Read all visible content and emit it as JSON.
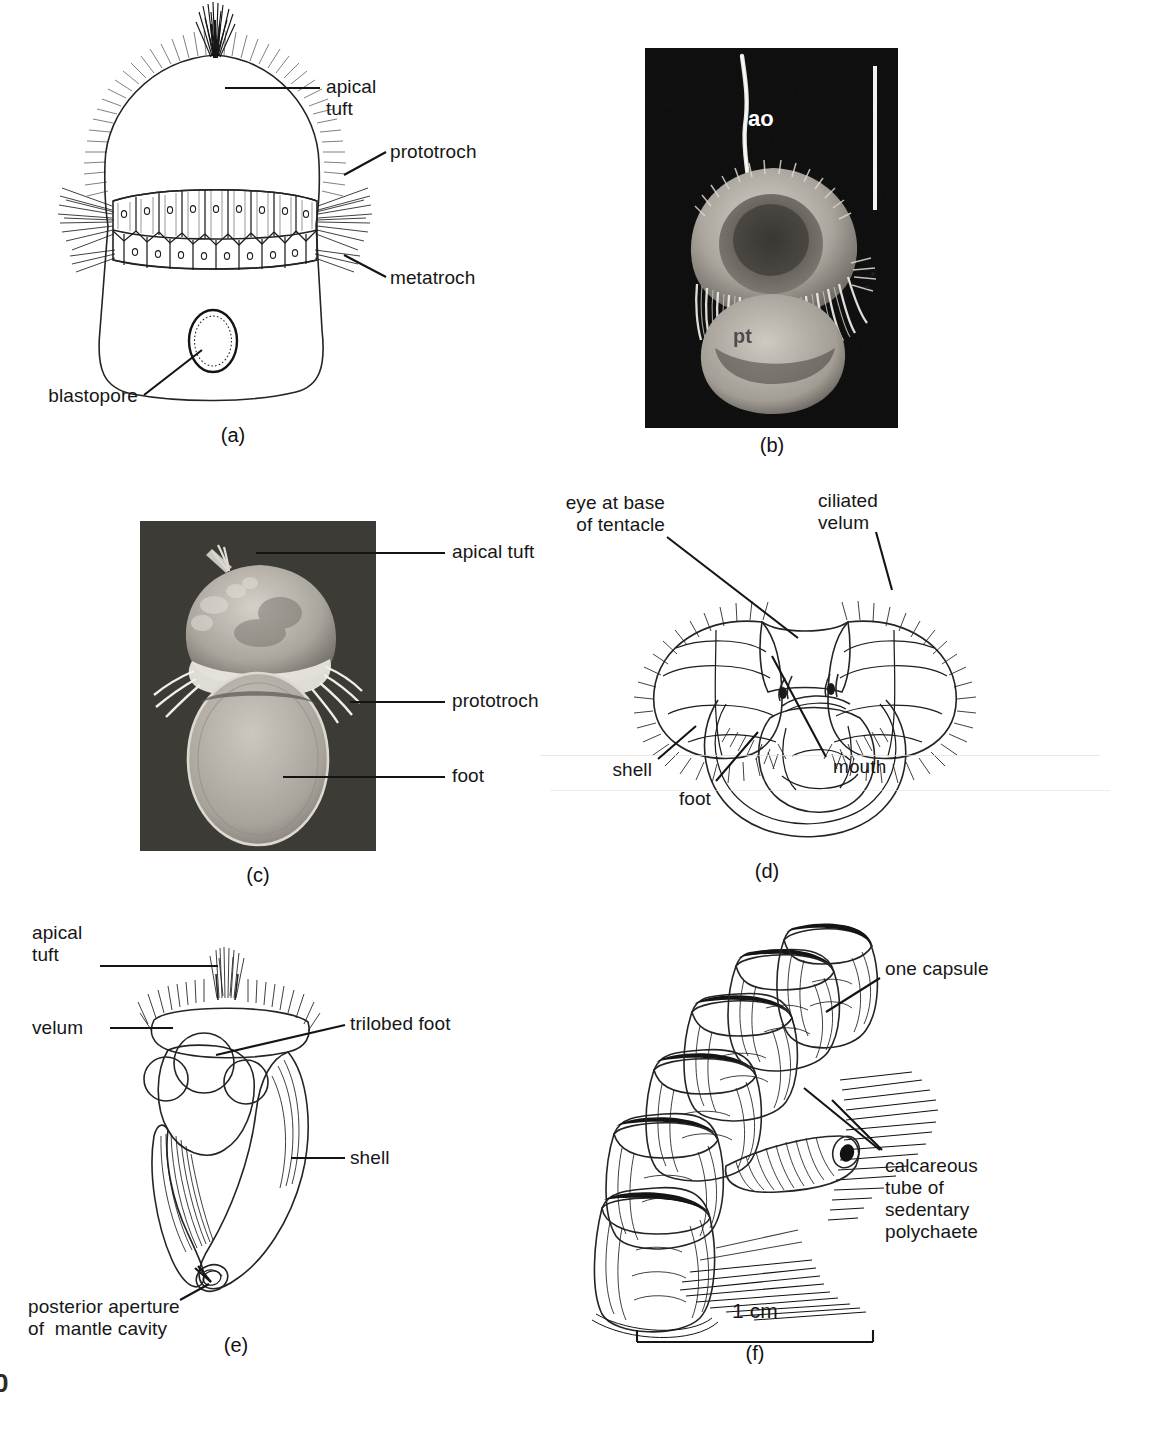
{
  "figure": {
    "page_number": "0",
    "panels": [
      {
        "id": "a",
        "caption": "(a)",
        "kind": "line-drawing",
        "subject": "trochophore larva",
        "labels": [
          {
            "name": "apical-tuft",
            "text": "apical\ntuft"
          },
          {
            "name": "prototroch",
            "text": "prototroch"
          },
          {
            "name": "metatroch",
            "text": "metatroch"
          },
          {
            "name": "blastopore",
            "text": "blastopore"
          }
        ]
      },
      {
        "id": "b",
        "caption": "(b)",
        "kind": "sem-micrograph",
        "subject": "trochophore larva SEM",
        "labels": [
          {
            "name": "ao-label",
            "text": "ao"
          },
          {
            "name": "pt-label",
            "text": "pt"
          }
        ],
        "scale_bar": {
          "name": "vertical-scale-bar",
          "orientation": "vertical"
        }
      },
      {
        "id": "c",
        "caption": "(c)",
        "kind": "sem-micrograph",
        "subject": "larva SEM with foot",
        "labels": [
          {
            "name": "apical-tuft",
            "text": "apical tuft"
          },
          {
            "name": "prototroch",
            "text": "prototroch"
          },
          {
            "name": "foot",
            "text": "foot"
          }
        ]
      },
      {
        "id": "d",
        "caption": "(d)",
        "kind": "line-drawing",
        "subject": "veliger larva, ventral view",
        "labels": [
          {
            "name": "eye-at-base-of-tentacle",
            "text": "eye at base\nof tentacle"
          },
          {
            "name": "ciliated-velum",
            "text": "ciliated\nvelum"
          },
          {
            "name": "shell",
            "text": "shell"
          },
          {
            "name": "foot",
            "text": "foot"
          },
          {
            "name": "mouth",
            "text": "mouth"
          }
        ]
      },
      {
        "id": "e",
        "caption": "(e)",
        "kind": "line-drawing",
        "subject": "veliger larva with shell, lateral view",
        "labels": [
          {
            "name": "apical-tuft",
            "text": "apical\ntuft"
          },
          {
            "name": "velum",
            "text": "velum"
          },
          {
            "name": "trilobed-foot",
            "text": "trilobed foot"
          },
          {
            "name": "shell",
            "text": "shell"
          },
          {
            "name": "posterior-aperture-of-mantle-cavity",
            "text": "posterior aperture\nof  mantle cavity"
          }
        ]
      },
      {
        "id": "f",
        "caption": "(f)",
        "kind": "line-drawing",
        "subject": "egg capsules on polychaete tube",
        "labels": [
          {
            "name": "one-capsule",
            "text": "one capsule"
          },
          {
            "name": "calcareous-tube-of-sedentary-polychaete",
            "text": "calcareous\ntube of\nsedentary\npolychaete"
          }
        ],
        "scale_bar": {
          "name": "scale-bar-1cm",
          "text": "1 cm",
          "length_label": "1 cm"
        }
      }
    ]
  },
  "colors": {
    "ink": "#141414",
    "paper": "#ffffff",
    "photo_background": "#0b0b0b",
    "photo_specimen": "#b9b5ad"
  }
}
